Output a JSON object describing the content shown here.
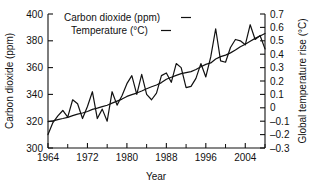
{
  "chart_data": {
    "type": "line",
    "title": "",
    "xlabel": "Year",
    "ylabel": "Carbon dioxide (ppm)",
    "y2label": "Global temperature rise (°C)",
    "grid": false,
    "legend_position": "top-left-inside",
    "xlim": [
      1964,
      2008
    ],
    "ylim": [
      300,
      400
    ],
    "y2lim": [
      -0.3,
      0.7
    ],
    "xticks": [
      1964,
      1972,
      1980,
      1988,
      1996,
      2004
    ],
    "xticklabels": [
      "1964",
      "1972",
      "1980",
      "1988",
      "1996",
      "2004"
    ],
    "xminorticks": [
      1968,
      1976,
      1984,
      1992,
      2000,
      2008
    ],
    "yticks": [
      300,
      320,
      340,
      360,
      380,
      400
    ],
    "yticklabels": [
      "300",
      "320",
      "340",
      "360",
      "380",
      "400"
    ],
    "y2ticks": [
      -0.3,
      -0.2,
      -0.1,
      0,
      0.1,
      0.2,
      0.3,
      0.4,
      0.5,
      0.6,
      0.7
    ],
    "y2ticklabels": [
      "–0.3",
      "–0.2",
      "–0.1",
      "0",
      "0.1",
      "0.2",
      "0.3",
      "0.4",
      "0.5",
      "0.6",
      "0.7"
    ],
    "series": [
      {
        "name": "Carbon dioxide (ppm)",
        "legend_label": "Carbon dioxide (ppm)",
        "legend_marker": "—",
        "axis": "left",
        "units": "ppm",
        "x": [
          1964,
          1965,
          1966,
          1967,
          1968,
          1969,
          1970,
          1971,
          1972,
          1973,
          1974,
          1975,
          1976,
          1977,
          1978,
          1979,
          1980,
          1981,
          1982,
          1983,
          1984,
          1985,
          1986,
          1987,
          1988,
          1989,
          1990,
          1991,
          1992,
          1993,
          1994,
          1995,
          1996,
          1997,
          1998,
          1999,
          2000,
          2001,
          2002,
          2003,
          2004,
          2005,
          2006,
          2007,
          2008
        ],
        "values": [
          319.6,
          320.3,
          321.2,
          322.0,
          322.9,
          324.2,
          325.3,
          326.1,
          327.2,
          328.8,
          329.8,
          330.9,
          331.9,
          333.5,
          335.0,
          336.5,
          338.5,
          339.8,
          341.0,
          342.5,
          344.2,
          345.7,
          347.0,
          348.8,
          351.3,
          352.8,
          354.2,
          355.5,
          356.3,
          357.0,
          358.6,
          360.6,
          362.4,
          363.5,
          366.4,
          368.2,
          369.3,
          371.0,
          373.1,
          375.6,
          377.4,
          379.6,
          381.8,
          383.6,
          385.5
        ]
      },
      {
        "name": "Temperature (°C)",
        "legend_label": "Temperature (°C)",
        "legend_marker": "—",
        "axis": "right",
        "units": "°C",
        "x": [
          1964,
          1965,
          1966,
          1967,
          1968,
          1969,
          1970,
          1971,
          1972,
          1973,
          1974,
          1975,
          1976,
          1977,
          1978,
          1979,
          1980,
          1981,
          1982,
          1983,
          1984,
          1985,
          1986,
          1987,
          1988,
          1989,
          1990,
          1991,
          1992,
          1993,
          1994,
          1995,
          1996,
          1997,
          1998,
          1999,
          2000,
          2001,
          2002,
          2003,
          2004,
          2005,
          2006,
          2007,
          2008
        ],
        "values": [
          -0.2,
          -0.11,
          -0.06,
          -0.02,
          -0.07,
          0.06,
          0.03,
          -0.08,
          0.01,
          0.12,
          -0.08,
          -0.01,
          -0.1,
          0.12,
          0.02,
          0.09,
          0.18,
          0.24,
          0.1,
          0.25,
          0.1,
          0.06,
          0.11,
          0.24,
          0.26,
          0.19,
          0.33,
          0.3,
          0.15,
          0.16,
          0.22,
          0.33,
          0.23,
          0.38,
          0.59,
          0.35,
          0.34,
          0.45,
          0.51,
          0.5,
          0.47,
          0.62,
          0.51,
          0.54,
          0.44
        ]
      }
    ]
  },
  "legend": {
    "entries": [
      {
        "label": "Carbon dioxide (ppm)",
        "dash": "—"
      },
      {
        "label": "Temperature (°C)",
        "dash": "—"
      }
    ]
  },
  "axes": {
    "left_title": "Carbon dioxide (ppm)",
    "right_title": "Global temperature rise (°C)",
    "bottom_title": "Year"
  },
  "colors": {
    "line": "#111111",
    "axis": "#111111",
    "background": "#ffffff"
  }
}
